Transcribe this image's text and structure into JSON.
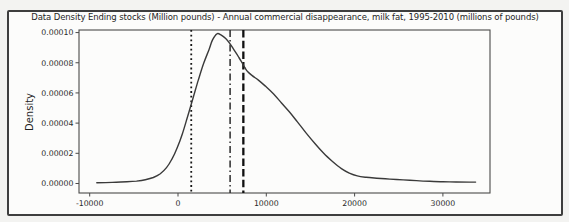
{
  "figure": {
    "title": "Data Density Ending stocks (Million pounds) - Annual commercial disappearance, milk fat, 1995-2010 (millions of pounds)",
    "ylabel": "Density"
  },
  "colors": {
    "page_bg": "#f3f3f1",
    "figure_bg": "#fcfcfb",
    "frame_border": "#3e3e3e",
    "spine": "#4a4a4a",
    "curve": "#3a3a3a",
    "tick_text": "#2a2a2a"
  },
  "chart_data": {
    "type": "line",
    "subtype": "kde-density",
    "title": "Data Density Ending stocks (Million pounds) - Annual commercial disappearance, milk fat, 1995-2010 (millions of pounds)",
    "xlabel": "",
    "ylabel": "Density",
    "grid": false,
    "legend_position": "none",
    "xlim": [
      -11212,
      35334
    ],
    "ylim": [
      -6.3e-06,
      0.0001017
    ],
    "x_ticks": {
      "values": [
        -10000,
        0,
        10000,
        20000,
        30000
      ],
      "labels": [
        "-10000",
        "0",
        "10000",
        "20000",
        "30000"
      ]
    },
    "y_ticks": {
      "values": [
        0,
        2e-05,
        4e-05,
        6e-05,
        8e-05,
        0.0001
      ],
      "labels": [
        "0.00000",
        "0.00002",
        "0.00004",
        "0.00006",
        "0.00008",
        "0.00010"
      ]
    },
    "vlines": [
      {
        "x": 1500,
        "style": "dotted",
        "color": "#161616",
        "width": 1.8
      },
      {
        "x": 5900,
        "style": "dashdot",
        "color": "#2b2b2b",
        "width": 1.5
      },
      {
        "x": 7400,
        "style": "dashed",
        "color": "#101010",
        "width": 2.3
      }
    ],
    "series": [
      {
        "name": "density",
        "color": "#3a3a3a",
        "points": [
          [
            -9200,
            5e-07
          ],
          [
            -8200,
            6e-07
          ],
          [
            -7000,
            8e-07
          ],
          [
            -5800,
            1.1e-06
          ],
          [
            -4700,
            1.6e-06
          ],
          [
            -3700,
            2.5e-06
          ],
          [
            -2800,
            4e-06
          ],
          [
            -2000,
            6.5e-06
          ],
          [
            -1300,
            1.05e-05
          ],
          [
            -700,
            1.6e-05
          ],
          [
            -100,
            2.35e-05
          ],
          [
            500,
            3.3e-05
          ],
          [
            1100,
            4.45e-05
          ],
          [
            1700,
            5.65e-05
          ],
          [
            2300,
            6.85e-05
          ],
          [
            2900,
            7.95e-05
          ],
          [
            3500,
            8.85e-05
          ],
          [
            3900,
            9.5e-05
          ],
          [
            4400,
            9.92e-05
          ],
          [
            4900,
            9.83e-05
          ],
          [
            5400,
            9.6e-05
          ],
          [
            5900,
            9.25e-05
          ],
          [
            6400,
            8.8e-05
          ],
          [
            6900,
            8.35e-05
          ],
          [
            7300,
            7.95e-05
          ],
          [
            7600,
            7.65e-05
          ],
          [
            7900,
            7.4e-05
          ],
          [
            8400,
            7.15e-05
          ],
          [
            9100,
            6.85e-05
          ],
          [
            9900,
            6.45e-05
          ],
          [
            10800,
            5.95e-05
          ],
          [
            11700,
            5.35e-05
          ],
          [
            12600,
            4.75e-05
          ],
          [
            13500,
            4.1e-05
          ],
          [
            14500,
            3.35e-05
          ],
          [
            15500,
            2.65e-05
          ],
          [
            16500,
            2e-05
          ],
          [
            17500,
            1.45e-05
          ],
          [
            18500,
            9.8e-06
          ],
          [
            19400,
            6.8e-06
          ],
          [
            20300,
            5e-06
          ],
          [
            21300,
            4.1e-06
          ],
          [
            22500,
            3.5e-06
          ],
          [
            24000,
            2.9e-06
          ],
          [
            25500,
            2.4e-06
          ],
          [
            27000,
            1.9e-06
          ],
          [
            28500,
            1.5e-06
          ],
          [
            30000,
            1.2e-06
          ],
          [
            31500,
            1e-06
          ],
          [
            33000,
            9e-07
          ],
          [
            33700,
            9e-07
          ]
        ]
      }
    ]
  }
}
